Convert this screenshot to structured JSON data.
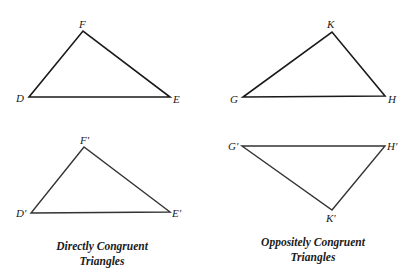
{
  "diagram": {
    "triangles": {
      "DEF": {
        "labels": {
          "D": "D",
          "E": "E",
          "F": "F"
        },
        "points": "29,97 170,97 83,31"
      },
      "GHK": {
        "labels": {
          "G": "G",
          "H": "H",
          "K": "K"
        },
        "points": "243,97 385,96 332,32"
      },
      "DEF_prime": {
        "labels": {
          "D": "D′",
          "E": "E′",
          "F": "F′"
        },
        "points": "31,213 170,212 84,147"
      },
      "GHK_prime": {
        "labels": {
          "G": "G′",
          "H": "H′",
          "K": "K′"
        },
        "points": "242,146 385,146 332,210"
      }
    },
    "captions": {
      "left": {
        "line1": "Directly Congruent",
        "line2": "Triangles"
      },
      "right": {
        "line1": "Oppositely Congruent",
        "line2": "Triangles"
      }
    },
    "colors": {
      "stroke": "#1a1a1a",
      "background": "#ffffff"
    }
  }
}
